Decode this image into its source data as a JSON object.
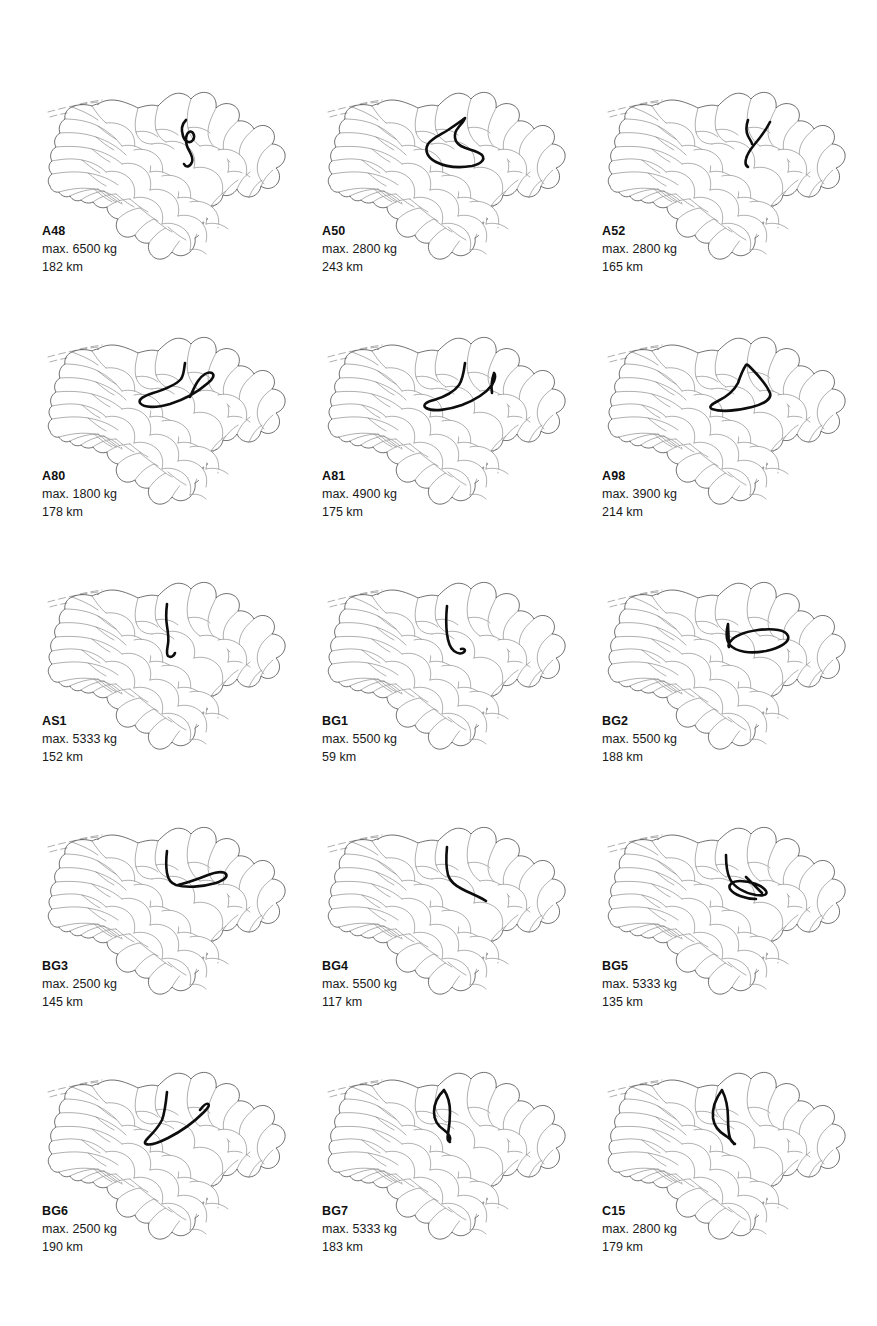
{
  "document": {
    "title": "Tour maps of Lower Saxony (Niedersachsen) districts",
    "background_color": "#ffffff",
    "ink_color": "#000000",
    "district_outline_color": "#6d6d6d",
    "route_color": "#0d0d0d",
    "grid": {
      "columns": 3,
      "rows": 5,
      "panel_count": 15
    }
  },
  "labels": {
    "max_prefix": "max.",
    "weight_unit": "kg",
    "distance_unit": "km"
  },
  "panels": [
    {
      "id": "A48",
      "max_weight": "max. 6500 kg",
      "distance": "182 km",
      "weight_value": 6500,
      "distance_value": 182,
      "route": "M146,38 C142,42 141,48 143,54 C145,60 150,62 153,58 C156,53 152,48 149,50 C146,52 145,58 147,64 C149,70 154,74 152,80 C150,85 146,86 144,82"
    },
    {
      "id": "A50",
      "max_weight": "max. 2800 kg",
      "distance": "243 km",
      "weight_value": 2800,
      "distance_value": 243,
      "route": "M145,36 C140,40 134,44 128,48 C120,53 112,56 108,62 C104,69 108,76 116,80 C126,85 140,86 152,84 C160,82 166,78 162,73 C157,68 148,68 141,64 C134,60 133,52 138,46 C141,42 144,39 145,36 Z"
    },
    {
      "id": "A52",
      "max_weight": "max. 2800 kg",
      "distance": "165 km",
      "weight_value": 2800,
      "distance_value": 165,
      "route": "M148,38 C146,44 146,50 148,54 C150,58 152,60 152,62 M170,40 C166,48 160,56 154,63 C150,68 147,72 146,77 C145,81 146,84 148,85"
    },
    {
      "id": "A80",
      "max_weight": "max. 1800 kg",
      "distance": "178 km",
      "weight_value": 1800,
      "distance_value": 178,
      "route": "M145,36 C144,42 144,48 141,52 C136,58 126,62 113,66 C104,69 98,72 100,76 C104,81 116,81 130,77 C146,72 160,63 168,56 C173,52 175,48 172,46 C168,44 162,48 158,54 C154,60 152,66 150,70"
    },
    {
      "id": "A81",
      "max_weight": "max. 4900 kg",
      "distance": "175 km",
      "weight_value": 4900,
      "distance_value": 175,
      "route": "M145,36 C144,44 143,52 139,58 C134,65 124,70 114,73 C106,75 102,78 106,81 C113,85 128,83 142,78 C155,73 166,66 172,58 C175,53 176,48 174,46 M174,46 C172,52 171,60 172,66"
    },
    {
      "id": "A98",
      "max_weight": "max. 3900 kg",
      "distance": "214 km",
      "weight_value": 3900,
      "distance_value": 214,
      "route": "M146,38 C142,44 140,50 138,56 C134,64 126,70 118,74 C112,77 108,80 112,82 C120,85 136,84 152,80 C164,77 172,72 170,66 C166,56 156,46 150,40 C148,38 147,37 146,38 Z"
    },
    {
      "id": "AS1",
      "max_weight": "max. 5333 kg",
      "distance": "152 km",
      "weight_value": 5333,
      "distance_value": 152,
      "route": "M127,32 C126,40 126,48 127,54 C128,60 129,66 128,72 C127,78 126,82 128,84 C131,86 134,84 135,81"
    },
    {
      "id": "BG1",
      "max_weight": "max. 5500 kg",
      "distance": "59 km",
      "weight_value": 5500,
      "distance_value": 59,
      "route": "M127,34 C126,44 126,54 127,62 C128,70 130,76 134,79 C138,82 142,82 144,80 C146,78 144,76 141,77"
    },
    {
      "id": "BG2",
      "max_weight": "max. 5500 kg",
      "distance": "188 km",
      "weight_value": 5500,
      "distance_value": 188,
      "route": "M128,52 C126,60 126,68 130,73 C136,80 150,82 166,79 C180,76 190,70 188,64 C186,58 174,56 158,58 C144,60 134,64 130,70 C128,73 128,74 129,75 Z"
    },
    {
      "id": "BG3",
      "max_weight": "max. 2500 kg",
      "distance": "145 km",
      "weight_value": 2500,
      "distance_value": 145,
      "route": "M127,34 C126,42 126,50 127,56 C128,62 130,66 136,68 C146,71 162,70 176,66 C184,63 188,60 186,57 C184,54 176,55 168,58 C158,62 146,66 138,68"
    },
    {
      "id": "BG4",
      "max_weight": "max. 5500 kg",
      "distance": "117 km",
      "weight_value": 5500,
      "distance_value": 117,
      "route": "M127,30 C126,40 126,50 128,58 C130,64 134,68 142,72 C152,77 162,81 166,84"
    },
    {
      "id": "BG5",
      "max_weight": "max. 5333 kg",
      "distance": "135 km",
      "weight_value": 5333,
      "distance_value": 135,
      "route": "M126,38 C126,48 127,56 130,62 C134,70 144,76 156,78 C164,79 168,78 166,74 C162,68 150,64 140,64 C132,64 128,68 130,72 C134,78 146,82 156,82 M146,60 C152,66 158,72 162,76"
    },
    {
      "id": "BG6",
      "max_weight": "max. 2500 kg",
      "distance": "190 km",
      "weight_value": 2500,
      "distance_value": 190,
      "route": "M127,30 C126,40 125,50 122,58 C118,66 112,72 108,76 C105,79 104,81 106,82 C110,84 118,81 128,76 C142,69 156,58 164,50 C168,46 170,43 168,42 C166,41 163,44 160,48"
    },
    {
      "id": "BG7",
      "max_weight": "max. 5333 kg",
      "distance": "183 km",
      "weight_value": 5333,
      "distance_value": 183,
      "route": "M124,28 C118,34 114,42 114,50 C114,58 118,64 124,68 C128,71 131,74 130,78 M124,28 C128,34 130,42 130,50 C130,58 129,66 128,72 C127,76 128,79 130,80"
    },
    {
      "id": "C15",
      "max_weight": "max. 2800 kg",
      "distance": "179 km",
      "weight_value": 2800,
      "distance_value": 179,
      "route": "M122,28 C116,36 112,46 113,56 C114,64 119,70 126,74 C130,77 133,79 134,82 M122,28 C126,36 128,46 128,56 C128,64 128,70 130,76 C131,79 133,81 135,82"
    }
  ],
  "map_geometry": {
    "description": "Lower Saxony district outlines, shared base map per panel",
    "viewbox": "0 0 250 200",
    "coastline_dashes": [
      "M8,30 C22,26 40,22 58,20",
      "M10,35 C16,33 22,32 27,31",
      "M40,22 C48,20 56,19 62,18"
    ],
    "outer_border": "M58,22 C64,18 72,17 80,19 C88,21 94,24 98,26 C104,24 112,22 118,24 C122,20 128,14 134,12 C140,10 147,12 151,17 C155,12 162,9 168,11 C174,13 177,19 176,26 C180,22 187,20 193,23 C199,26 201,33 198,39 C204,38 211,41 214,47 C218,43 225,42 230,46 C235,50 236,57 232,62 C238,62 244,66 245,72 C246,78 242,84 236,86 C240,90 241,97 237,102 C233,107 226,108 221,104 C220,110 215,115 209,115 C204,115 199,112 197,107 C194,112 188,115 183,113 C182,119 177,124 171,124 C172,130 169,137 163,140 C164,146 161,153 155,156 C156,162 153,169 147,172 C142,175 136,174 132,170 C128,176 121,179 115,176 C110,173 107,167 109,161 C103,162 97,159 95,153 C90,156 84,156 80,152 C76,148 75,142 78,137 C72,136 67,131 67,125 C62,127 56,125 53,120 C49,122 44,121 41,118 C37,120 32,118 30,114 C26,116 21,114 19,110 C15,111 11,108 10,104 C7,100 8,95 12,92 C8,88 8,82 12,79 C9,74 11,68 16,65 C13,60 15,54 20,51 C18,46 20,40 25,37 C24,32 27,27 32,25 C38,22 46,22 52,24 C54,23 56,22 58,22 Z",
    "district_lines": [
      "M98,26 C96,34 94,42 96,50 C98,58 104,62 112,62",
      "M118,24 C116,32 114,40 116,48 C118,54 122,58 126,60",
      "M151,17 C148,26 146,36 148,46 C150,54 154,60 160,64",
      "M176,26 C172,34 168,42 168,50 C168,58 172,64 178,68",
      "M198,39 C192,44 186,50 184,58 C182,66 184,74 190,80",
      "M214,47 C208,52 202,58 200,66 C198,74 200,82 206,88",
      "M232,62 C226,66 220,72 218,80 C216,88 218,96 224,102",
      "M12,79 C22,77 32,76 42,78 C52,80 60,84 66,90",
      "M12,92 C24,90 36,89 48,91 C60,93 70,97 78,103",
      "M19,110 C30,107 42,105 54,107 C66,109 76,114 82,121",
      "M30,114 C38,110 48,107 58,107",
      "M41,118 C48,113 56,110 64,109",
      "M53,120 C60,115 68,112 76,112",
      "M67,125 C74,120 82,117 90,117",
      "M78,137 C84,131 92,127 100,126",
      "M95,153 C100,146 106,140 114,137",
      "M109,161 C114,154 120,148 128,145",
      "M132,170 C136,163 141,156 148,151",
      "M155,156 C158,149 162,142 168,137",
      "M163,140 C166,133 170,127 176,122",
      "M171,124 C175,118 180,113 186,109",
      "M183,113 C187,107 192,102 198,98",
      "M197,107 C200,100 204,94 210,90",
      "M209,115 C212,108 216,102 222,98",
      "M221,104 C224,97 228,92 233,88",
      "M16,65 C28,64 40,64 52,67 C64,70 74,75 82,82",
      "M20,51 C32,50 44,51 56,55 C68,59 78,65 86,73",
      "M25,37 C36,37 48,39 58,44 C68,49 76,56 82,64",
      "M32,25 C40,28 50,32 58,38",
      "M52,24 C56,30 60,36 66,41",
      "M66,41 C74,40 82,42 88,47 C94,52 96,60 94,68",
      "M82,64 C90,62 98,64 104,69 C110,74 112,82 110,90",
      "M82,82 C90,80 98,82 104,87 C110,92 112,100 110,108",
      "M66,90 C74,88 82,90 88,95 C94,100 96,108 94,116",
      "M94,68 C102,66 110,68 116,73 C122,78 124,86 122,94",
      "M110,90 C118,88 126,90 132,95 C138,100 140,108 138,116",
      "M110,108 C118,106 126,108 132,113 C138,118 140,126 138,134",
      "M94,116 C102,114 110,116 116,121 C122,126 124,134 122,142",
      "M122,94 C130,92 138,94 144,99 C150,104 152,112 150,120",
      "M138,116 C146,114 154,116 160,121 C166,126 168,134 166,142",
      "M138,134 C146,132 154,134 160,139 C166,144 168,152 166,160",
      "M150,120 C158,118 166,120 172,125 C178,130 180,138 178,146",
      "M166,142 C174,140 182,142 188,147",
      "M160,64 C168,62 176,64 182,69 C188,74 190,82 188,90",
      "M126,60 C134,58 142,60 148,65 C154,70 156,78 154,86",
      "M112,62 C120,60 128,62 134,67",
      "M154,86 C162,84 170,86 176,91 C182,96 184,104 182,112",
      "M188,90 C196,88 204,90 210,95",
      "M178,68 C186,66 194,68 200,73 C206,78 208,86 206,94",
      "M148,46 C156,44 164,46 170,51",
      "M116,48 C124,46 132,48 138,53",
      "M96,50 C104,48 112,50 118,55",
      "M122,142 C130,140 138,142 144,147 C150,152 152,160 150,168",
      "M150,168 C156,166 162,168 166,172",
      "M128,145 C134,150 140,155 146,158",
      "M114,137 C120,142 126,147 132,150",
      "M100,126 C106,131 112,136 118,139",
      "M90,117 C96,122 102,127 108,130",
      "M76,112 C82,117 88,122 94,125",
      "M64,109 C70,114 76,119 82,122",
      "M58,107 C64,112 70,117 76,120",
      "M42,78 C48,83 54,88 60,91",
      "M48,91 C54,96 60,101 66,104",
      "M54,107 C60,112 66,117 72,120",
      "M52,67 C58,72 64,77 70,80",
      "M56,55 C62,60 68,65 74,68",
      "M58,44 C64,49 70,54 76,57"
    ]
  }
}
